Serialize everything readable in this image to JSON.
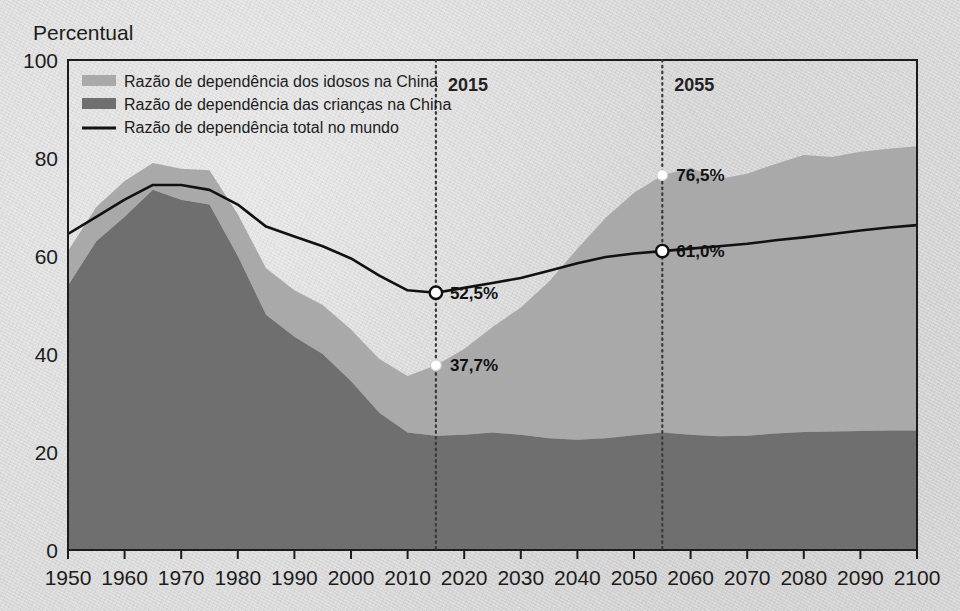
{
  "axis": {
    "y_title": "Percentual",
    "y_ticks": [
      "0",
      "20",
      "40",
      "60",
      "80",
      "100"
    ],
    "x_ticks": [
      "1950",
      "1960",
      "1970",
      "1980",
      "1990",
      "2000",
      "2010",
      "2020",
      "2030",
      "2040",
      "2050",
      "2060",
      "2070",
      "2080",
      "2090",
      "2100"
    ]
  },
  "legend": {
    "items": [
      {
        "label": "Razão de dependência dos idosos na China",
        "marker": "swatch-light",
        "color": "#a9a9a9"
      },
      {
        "label": "Razão de dependência das crianças na China",
        "marker": "swatch-dark",
        "color": "#6f6f6f"
      },
      {
        "label": "Razão de dependência total no mundo",
        "marker": "line-black",
        "color": "#111111"
      }
    ]
  },
  "markers": {
    "year_2015_label": "2015",
    "year_2055_label": "2055",
    "annotations": [
      {
        "text": "52,5%",
        "year": 2015,
        "value": 52.5,
        "series": "world-total"
      },
      {
        "text": "37,7%",
        "year": 2015,
        "value": 37.7,
        "series": "china-total"
      },
      {
        "text": "76,5%",
        "year": 2055,
        "value": 76.5,
        "series": "china-total"
      },
      {
        "text": "61,0%",
        "year": 2055,
        "value": 61.0,
        "series": "world-total"
      }
    ]
  },
  "colors": {
    "elderly_area": "#a9a9a9",
    "children_area": "#6f6f6f",
    "world_line": "#111111",
    "background": "#d9d9d9",
    "axis": "#1c1c1c",
    "guide_line": "#3a3a3a"
  },
  "chart_data": {
    "type": "area",
    "title": "",
    "subtitle": "",
    "xlabel": "",
    "ylabel": "Percentual",
    "xlim": [
      1950,
      2100
    ],
    "ylim": [
      0,
      100
    ],
    "grid": false,
    "legend_position": "top-left",
    "stacked": true,
    "x": [
      1950,
      1955,
      1960,
      1965,
      1970,
      1975,
      1980,
      1985,
      1990,
      1995,
      2000,
      2005,
      2010,
      2015,
      2020,
      2025,
      2030,
      2035,
      2040,
      2045,
      2050,
      2055,
      2060,
      2065,
      2070,
      2075,
      2080,
      2085,
      2090,
      2095,
      2100
    ],
    "series": [
      {
        "name": "Razão de dependência das crianças na China",
        "type": "area-stacked",
        "color": "#6f6f6f",
        "values": [
          54.0,
          63.0,
          68.0,
          73.5,
          71.5,
          70.5,
          60.0,
          48.0,
          43.5,
          40.0,
          34.5,
          28.0,
          24.0,
          23.3,
          23.5,
          24.0,
          23.5,
          22.8,
          22.5,
          22.8,
          23.4,
          24.0,
          23.5,
          23.2,
          23.3,
          23.8,
          24.1,
          24.2,
          24.3,
          24.4,
          24.4
        ]
      },
      {
        "name": "Razão de dependência dos idosos na China",
        "type": "area-stacked",
        "color": "#a9a9a9",
        "values": [
          7.0,
          7.0,
          7.3,
          5.5,
          6.3,
          7.0,
          8.5,
          9.5,
          9.5,
          10.0,
          10.5,
          11.0,
          11.5,
          14.4,
          17.5,
          21.5,
          26.0,
          32.0,
          39.0,
          45.0,
          49.5,
          52.5,
          54.5,
          52.5,
          53.5,
          55.0,
          56.5,
          56.0,
          57.0,
          57.5,
          58.0
        ]
      },
      {
        "name": "Razão de dependência total na China (topo empilhado)",
        "type": "derived-stack-top",
        "values": [
          61.0,
          70.0,
          75.3,
          79.0,
          77.8,
          77.5,
          68.5,
          57.5,
          53.0,
          50.0,
          45.0,
          39.0,
          35.5,
          37.7,
          41.0,
          45.5,
          49.5,
          54.8,
          61.5,
          67.8,
          72.9,
          76.5,
          78.0,
          75.7,
          76.8,
          78.8,
          80.6,
          80.2,
          81.3,
          81.9,
          82.4
        ]
      },
      {
        "name": "Razão de dependência total no mundo",
        "type": "line",
        "color": "#111111",
        "values": [
          64.5,
          68.0,
          71.5,
          74.5,
          74.5,
          73.5,
          70.5,
          66.0,
          64.0,
          62.0,
          59.5,
          56.0,
          53.0,
          52.5,
          53.5,
          54.5,
          55.5,
          57.0,
          58.5,
          59.8,
          60.5,
          61.0,
          61.5,
          62.0,
          62.5,
          63.2,
          63.8,
          64.5,
          65.2,
          65.8,
          66.3
        ]
      }
    ],
    "reference_lines": [
      {
        "x": 2015,
        "label": "2015",
        "style": "dotted"
      },
      {
        "x": 2055,
        "label": "2055",
        "style": "dotted"
      }
    ]
  }
}
